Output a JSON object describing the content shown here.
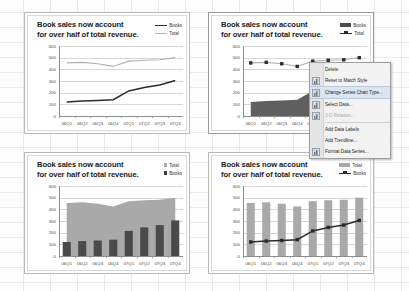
{
  "app": {
    "name": "spreadsheet-canvas"
  },
  "common": {
    "title_line1": "Book sales now account",
    "title_line2": "for over half of total revenue.",
    "y_ticks": [
      "600",
      "500",
      "400",
      "300",
      "200",
      "100",
      "0"
    ],
    "x_ticks": [
      "06Q1",
      "06Q2",
      "06Q3",
      "06Q4",
      "07Q1",
      "07Q2",
      "07Q3",
      "07Q4"
    ],
    "series_books": "Books",
    "series_total": "Total"
  },
  "colors": {
    "books_dark": "#2b2b2b",
    "total_light": "#b3b3b3",
    "bar_dark": "#4a4a4a",
    "area_gray": "#a9a9a9",
    "area_dark": "#5f5f5f",
    "bar_gray": "#a9a9a9",
    "gridline": "#d6d6d6",
    "menu_bg": "#f2f2f2",
    "menu_highlight": "#dbe5f1"
  },
  "charts": [
    {
      "id": "chart-top-left",
      "type_label": "line-line",
      "legend": [
        {
          "label": "Books",
          "swatch": "line-dark"
        },
        {
          "label": "Total",
          "swatch": "line-light"
        }
      ]
    },
    {
      "id": "chart-top-right",
      "type_label": "area-line",
      "legend": [
        {
          "label": "Books",
          "swatch": "box-dark"
        },
        {
          "label": "Total",
          "swatch": "line-marker"
        }
      ]
    },
    {
      "id": "chart-bottom-left",
      "type_label": "area-column",
      "legend": [
        {
          "label": "Total",
          "swatch": "square-light"
        },
        {
          "label": "Books",
          "swatch": "square-dark"
        }
      ]
    },
    {
      "id": "chart-bottom-right",
      "type_label": "column-line",
      "legend": [
        {
          "label": "Total",
          "swatch": "box-gray"
        },
        {
          "label": "Books",
          "swatch": "line-marker"
        }
      ]
    }
  ],
  "chart_data": [
    {
      "id": "chart-top-left",
      "type": "line",
      "title": "Book sales now account for over half of total revenue.",
      "categories": [
        "06Q1",
        "06Q2",
        "06Q3",
        "06Q4",
        "07Q1",
        "07Q2",
        "07Q3",
        "07Q4"
      ],
      "series": [
        {
          "name": "Books",
          "values": [
            120,
            128,
            133,
            140,
            215,
            245,
            265,
            305
          ]
        },
        {
          "name": "Total",
          "values": [
            455,
            460,
            448,
            425,
            470,
            478,
            482,
            500
          ]
        }
      ],
      "xlabel": "",
      "ylabel": "",
      "ylim": [
        0,
        600
      ],
      "yticks": [
        0,
        100,
        200,
        300,
        400,
        500,
        600
      ],
      "grid": true,
      "legend_position": "top-right"
    },
    {
      "id": "chart-top-right",
      "type": "area",
      "title": "Book sales now account for over half of total revenue.",
      "categories": [
        "06Q1",
        "06Q2",
        "06Q3",
        "06Q4",
        "07Q1",
        "07Q2",
        "07Q3",
        "07Q4"
      ],
      "series": [
        {
          "name": "Books",
          "values": [
            120,
            128,
            133,
            140,
            215,
            245,
            265,
            305
          ],
          "render": "area"
        },
        {
          "name": "Total",
          "values": [
            455,
            460,
            448,
            425,
            470,
            478,
            482,
            500
          ],
          "render": "line-marker"
        }
      ],
      "xlabel": "",
      "ylabel": "",
      "ylim": [
        0,
        600
      ],
      "yticks": [
        0,
        100,
        200,
        300,
        400,
        500,
        600
      ],
      "grid": true,
      "legend_position": "top-right"
    },
    {
      "id": "chart-bottom-left",
      "type": "area",
      "title": "Book sales now account for over half of total revenue.",
      "categories": [
        "06Q1",
        "06Q2",
        "06Q3",
        "06Q4",
        "07Q1",
        "07Q2",
        "07Q3",
        "07Q4"
      ],
      "series": [
        {
          "name": "Total",
          "values": [
            455,
            460,
            448,
            425,
            470,
            478,
            482,
            500
          ],
          "render": "area"
        },
        {
          "name": "Books",
          "values": [
            120,
            128,
            133,
            140,
            215,
            245,
            265,
            305
          ],
          "render": "column"
        }
      ],
      "xlabel": "",
      "ylabel": "",
      "ylim": [
        0,
        600
      ],
      "yticks": [
        0,
        100,
        200,
        300,
        400,
        500,
        600
      ],
      "grid": true,
      "legend_position": "top-right"
    },
    {
      "id": "chart-bottom-right",
      "type": "bar",
      "title": "Book sales now account for over half of total revenue.",
      "categories": [
        "06Q1",
        "06Q2",
        "06Q3",
        "06Q4",
        "07Q1",
        "07Q2",
        "07Q3",
        "07Q4"
      ],
      "series": [
        {
          "name": "Total",
          "values": [
            455,
            460,
            448,
            425,
            470,
            478,
            482,
            500
          ],
          "render": "column"
        },
        {
          "name": "Books",
          "values": [
            120,
            128,
            133,
            140,
            215,
            245,
            265,
            305
          ],
          "render": "line-marker"
        }
      ],
      "xlabel": "",
      "ylabel": "",
      "ylim": [
        0,
        600
      ],
      "yticks": [
        0,
        100,
        200,
        300,
        400,
        500,
        600
      ],
      "grid": true,
      "legend_position": "top-right"
    }
  ],
  "context_menu": {
    "items": [
      {
        "label": "Delete",
        "icon": "delete-icon",
        "disabled": false,
        "highlighted": false,
        "has_icon": false
      },
      {
        "label": "Reset to Match Style",
        "icon": "reset-style-icon",
        "disabled": false,
        "highlighted": false,
        "has_icon": true
      },
      {
        "label": "Change Series Chart Type...",
        "icon": "change-chart-type-icon",
        "disabled": false,
        "highlighted": true,
        "has_icon": true
      },
      {
        "label": "Select Data...",
        "icon": "select-data-icon",
        "disabled": false,
        "highlighted": false,
        "has_icon": true
      },
      {
        "label": "3-D Rotation...",
        "icon": "rotation-icon",
        "disabled": true,
        "highlighted": false,
        "has_icon": true
      },
      {
        "label": "Add Data Labels",
        "icon": "data-labels-icon",
        "disabled": false,
        "highlighted": false,
        "has_icon": false
      },
      {
        "label": "Add Trendline...",
        "icon": "trendline-icon",
        "disabled": false,
        "highlighted": false,
        "has_icon": false
      },
      {
        "label": "Format Data Series...",
        "icon": "format-series-icon",
        "disabled": false,
        "highlighted": false,
        "has_icon": true
      }
    ]
  }
}
